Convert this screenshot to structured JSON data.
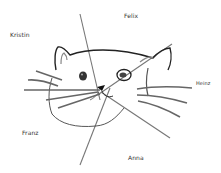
{
  "drawing": {
    "subject": "cat face sketch with radial lines",
    "names": [
      {
        "id": "felix",
        "label": "Felix",
        "x": 124,
        "y": 12
      },
      {
        "id": "kristin",
        "label": "Kristin",
        "x": 10,
        "y": 31
      },
      {
        "id": "heinz",
        "label": "Heinz",
        "x": 196,
        "y": 80
      },
      {
        "id": "franz",
        "label": "Franz",
        "x": 22,
        "y": 129
      },
      {
        "id": "anna",
        "label": "Anna",
        "x": 128,
        "y": 154
      }
    ],
    "colors": {
      "ink": "#222222",
      "pencil": "#777777",
      "background": "#ffffff"
    }
  }
}
